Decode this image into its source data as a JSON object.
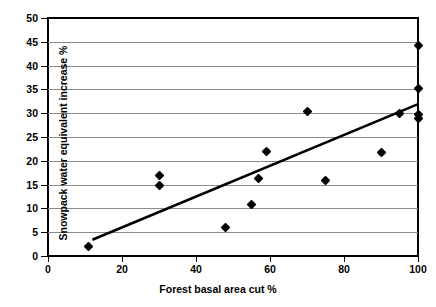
{
  "chart_data": {
    "type": "scatter",
    "title": "",
    "xlabel": "Forest basal area cut %",
    "ylabel": "Snowpack water equivalent increase %",
    "xlim": [
      0,
      100
    ],
    "ylim": [
      0,
      50
    ],
    "xticks": [
      0,
      20,
      40,
      60,
      80,
      100
    ],
    "yticks": [
      0,
      5,
      10,
      15,
      20,
      25,
      30,
      35,
      40,
      45,
      50
    ],
    "grid": "horizontal",
    "legend": "none",
    "marker": "filled-diamond",
    "marker_color": "#000000",
    "gridline_color": "#8a8a8a",
    "axis_color": "#000000",
    "points": [
      {
        "x": 11,
        "y": 2.0
      },
      {
        "x": 30,
        "y": 17.0
      },
      {
        "x": 30,
        "y": 14.9
      },
      {
        "x": 48,
        "y": 5.9
      },
      {
        "x": 55,
        "y": 10.8
      },
      {
        "x": 57,
        "y": 16.3
      },
      {
        "x": 59,
        "y": 21.9
      },
      {
        "x": 70,
        "y": 30.3
      },
      {
        "x": 75,
        "y": 15.8
      },
      {
        "x": 90,
        "y": 21.8
      },
      {
        "x": 95,
        "y": 29.9
      },
      {
        "x": 100,
        "y": 44.3
      },
      {
        "x": 100,
        "y": 35.2
      },
      {
        "x": 100,
        "y": 29.8
      },
      {
        "x": 100,
        "y": 28.8
      }
    ],
    "trendline": {
      "type": "linear",
      "x_start": 12,
      "y_start": 3.4,
      "x_end": 100,
      "y_end": 31.9,
      "color": "#000000",
      "width": 2.6
    }
  }
}
